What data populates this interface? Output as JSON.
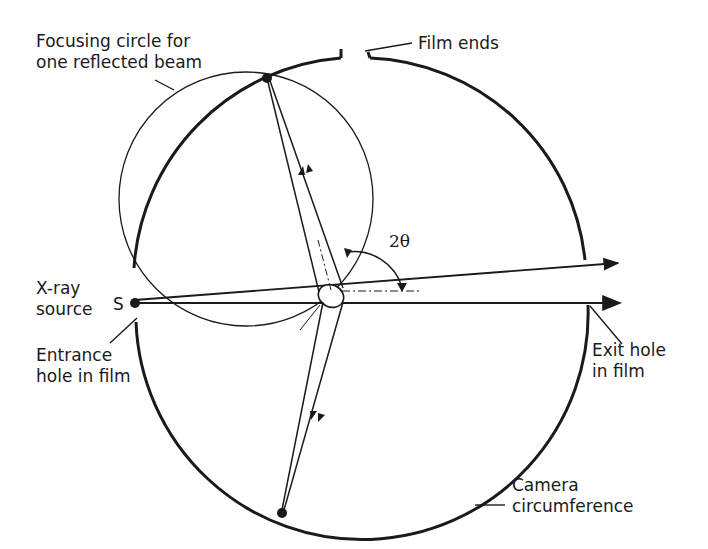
{
  "diagram": {
    "labels": {
      "focusing_circle": [
        "Focusing circle for",
        "one reflected beam"
      ],
      "film_ends": "Film ends",
      "xray_source": [
        "X-ray",
        "source"
      ],
      "source_point": "S",
      "entrance_hole": [
        "Entrance",
        "hole in film"
      ],
      "exit_hole": [
        "Exit hole",
        "in film"
      ],
      "camera_circumference": [
        "Camera",
        "circumference"
      ],
      "angle": "2θ"
    },
    "colors": {
      "ink": "#1a1a1a",
      "background": "#ffffff"
    }
  }
}
